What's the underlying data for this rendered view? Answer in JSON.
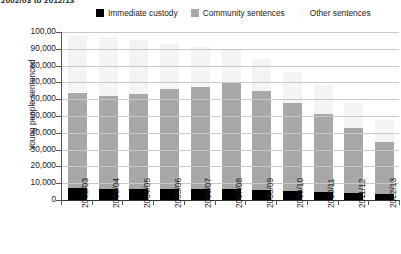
{
  "top_caption": "2002/03 to 2012/13",
  "chart_data": {
    "type": "bar",
    "subtype": "stacked-bar",
    "title": "",
    "xlabel": "",
    "ylabel": "Young people sentenced",
    "ylim": [
      0,
      100000
    ],
    "ytick_values": [
      0,
      10000,
      20000,
      30000,
      40000,
      50000,
      60000,
      70000,
      80000,
      90000,
      100000
    ],
    "ytick_labels": [
      "0",
      "10,000",
      "20,000",
      "30,000",
      "40,000",
      "50,000",
      "60,000",
      "70,000",
      "80,000",
      "90,000",
      "100,00"
    ],
    "grid": true,
    "legend_position": "top",
    "categories": [
      "2002/03",
      "2003/04",
      "2004/05",
      "2005/06",
      "2006/07",
      "2007/08",
      "2008/09",
      "2009/10",
      "2010/11",
      "2011/12",
      "2022/13"
    ],
    "series": [
      {
        "name": "Immediate custody",
        "color": "#000000",
        "values": [
          7000,
          6800,
          6800,
          6800,
          6700,
          6500,
          6200,
          5200,
          4600,
          4200,
          3500
        ]
      },
      {
        "name": "Community sentences",
        "color": "#a8a8a8",
        "values": [
          57000,
          55200,
          56200,
          59200,
          60300,
          63500,
          58800,
          52800,
          46400,
          38800,
          31000
        ]
      },
      {
        "name": "Other sentences",
        "color": "#f4f4f4",
        "values": [
          33500,
          35000,
          32000,
          27000,
          24000,
          20000,
          19000,
          18000,
          17500,
          15000,
          13000
        ]
      }
    ],
    "totals": [
      97500,
      97000,
      95000,
      93000,
      91000,
      90000,
      84000,
      76000,
      68500,
      58000,
      47500
    ]
  },
  "legend": {
    "items": [
      {
        "label": "Immediate custody",
        "swatch": "sw-black",
        "icon": "legend-swatch-black"
      },
      {
        "label": "Community sentences",
        "swatch": "sw-gray",
        "icon": "legend-swatch-gray"
      },
      {
        "label": "Other sentences",
        "swatch": "sw-light",
        "icon": "legend-swatch-light"
      }
    ]
  }
}
